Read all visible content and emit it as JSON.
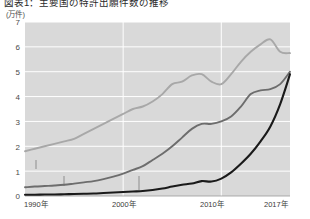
{
  "chart_data": {
    "type": "line",
    "title": "図表1：主要国の特許出願件数の推移",
    "unit": "(万件)",
    "xlabel": "",
    "ylabel": "",
    "ylim": [
      0,
      7
    ],
    "yticks": [
      0,
      1,
      2,
      3,
      4,
      5,
      6,
      7
    ],
    "xlim": [
      1990,
      2017
    ],
    "xticks": [
      1990,
      2000,
      2010,
      2017
    ],
    "xtick_labels": [
      "1990年",
      "2000年",
      "2010年",
      "2017年"
    ],
    "grid": true,
    "legend_position": "inline-annotations",
    "x": [
      1990,
      1991,
      1992,
      1993,
      1994,
      1995,
      1996,
      1997,
      1998,
      1999,
      2000,
      2001,
      2002,
      2003,
      2004,
      2005,
      2006,
      2007,
      2008,
      2009,
      2010,
      2011,
      2012,
      2013,
      2014,
      2015,
      2016,
      2017
    ],
    "series": [
      {
        "name": "米国",
        "color": "#a8a8a8",
        "values": [
          1.8,
          1.9,
          2.0,
          2.1,
          2.2,
          2.3,
          2.5,
          2.7,
          2.9,
          3.1,
          3.3,
          3.5,
          3.6,
          3.8,
          4.1,
          4.5,
          4.6,
          4.85,
          4.9,
          4.6,
          4.5,
          4.9,
          5.4,
          5.8,
          6.1,
          6.3,
          5.8,
          5.75
        ]
      },
      {
        "name": "日本",
        "color": "#6d6d6d",
        "values": [
          0.35,
          0.38,
          0.4,
          0.42,
          0.45,
          0.5,
          0.55,
          0.6,
          0.68,
          0.78,
          0.9,
          1.05,
          1.2,
          1.45,
          1.7,
          2.0,
          2.35,
          2.7,
          2.9,
          2.9,
          3.0,
          3.2,
          3.6,
          4.1,
          4.25,
          4.3,
          4.5,
          5.0
        ]
      },
      {
        "name": "中国",
        "color": "#1a1a1a",
        "values": [
          0.05,
          0.05,
          0.06,
          0.06,
          0.07,
          0.08,
          0.09,
          0.1,
          0.12,
          0.14,
          0.16,
          0.18,
          0.2,
          0.24,
          0.3,
          0.38,
          0.45,
          0.5,
          0.6,
          0.58,
          0.7,
          0.95,
          1.3,
          1.7,
          2.2,
          2.8,
          3.7,
          4.9
        ]
      }
    ],
    "annotations": [
      {
        "label": "米国",
        "series": "米国"
      },
      {
        "label": "日本",
        "series": "日本"
      },
      {
        "label": "中国",
        "series": "中国"
      }
    ],
    "colors": {
      "plot_background": "#d9d9d9",
      "gridline": "#ffffff",
      "axis_text": "#3a3a3a",
      "us": "#a8a8a8",
      "japan": "#6d6d6d",
      "china": "#1a1a1a"
    }
  }
}
